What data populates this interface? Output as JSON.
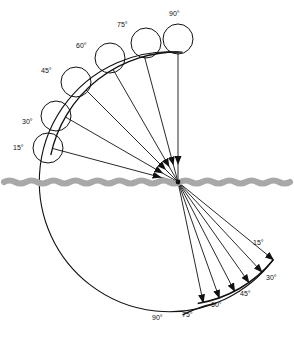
{
  "figure": {
    "type": "optics-ray-diagram",
    "width": 294,
    "height": 344,
    "background_color": "#ffffff",
    "line_color": "#111111",
    "surface_color": "#a8a8a8"
  },
  "geometry": {
    "origin_x": 178,
    "origin_y": 182,
    "incident_radius": 130,
    "refracted_radius": 123,
    "marker_circle_radius": 15,
    "marker_circle_offset": 20
  },
  "surface": {
    "name": "water-surface",
    "y": 182,
    "x_start": 4,
    "x_end": 290,
    "wave_amplitude": 3,
    "wave_period": 22,
    "stroke_width": 6,
    "color": "#a8a8a8"
  },
  "incident": {
    "label_group": "incident-angles",
    "description": "Rays arriving from upper left, each labelled by its angle above the surface, with a small open circle marking the source position.",
    "rays": [
      {
        "angle": 15,
        "label": "15°",
        "label_x": 13,
        "label_y": 150,
        "circle_cx": 48,
        "circle_cy": 148
      },
      {
        "angle": 30,
        "label": "30°",
        "label_x": 22,
        "label_y": 124,
        "circle_cx": 56,
        "circle_cy": 116
      },
      {
        "angle": 45,
        "label": "45°",
        "label_x": 41,
        "label_y": 73,
        "circle_cx": 76,
        "circle_cy": 82
      },
      {
        "angle": 60,
        "label": "60°",
        "label_x": 76,
        "label_y": 48,
        "circle_cx": 110,
        "circle_cy": 58
      },
      {
        "angle": 75,
        "label": "75°",
        "label_x": 117,
        "label_y": 27,
        "circle_cx": 146,
        "circle_cy": 43
      },
      {
        "angle": 90,
        "label": "90°",
        "label_x": 169,
        "label_y": 16,
        "circle_cx": 178,
        "circle_cy": 39
      }
    ]
  },
  "refracted": {
    "label_group": "refracted-angles",
    "description": "Rays continuing below the surface, bunched together and labelled along the lower arc.",
    "rays": [
      {
        "angle": 15,
        "label": "15°",
        "label_x": 253,
        "label_y": 245
      },
      {
        "angle": 30,
        "label": "30°",
        "label_x": 266,
        "label_y": 280
      },
      {
        "angle": 45,
        "label": "45°",
        "label_x": 240,
        "label_y": 296
      },
      {
        "angle": 60,
        "label": "60°",
        "label_x": 211,
        "label_y": 307
      },
      {
        "angle": 75,
        "label": "75°",
        "label_x": 182,
        "label_y": 317
      },
      {
        "angle": 90,
        "label": "90°",
        "label_x": 152,
        "label_y": 320
      }
    ]
  },
  "arcs": {
    "upper_arc_name": "incident-arc",
    "lower_arc_name": "refracted-arc",
    "outer_left_arc_name": "outer-boundary-arc",
    "tail_arc_name": "arc-tail"
  }
}
